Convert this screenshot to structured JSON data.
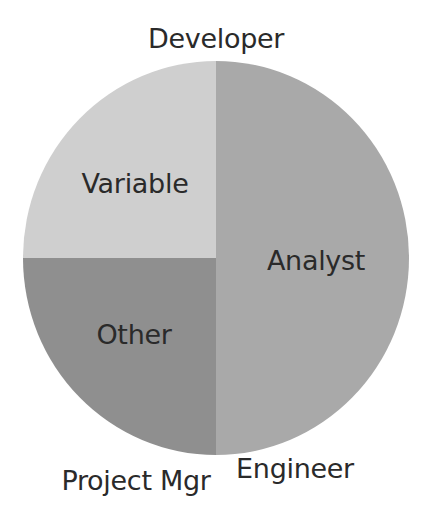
{
  "chart_data": {
    "type": "pie",
    "title": "",
    "categories": [
      "Developer",
      "Analyst",
      "Engineer",
      "Project Mgr",
      "Other",
      "Variable"
    ],
    "values": [
      0,
      50,
      0,
      0,
      25,
      25
    ],
    "colors": [
      "#b0b0b0",
      "#a9a9a9",
      "#9a9a9a",
      "#8c8c8c",
      "#8f8f8f",
      "#cfcfcf"
    ],
    "start_angle_deg": 0,
    "direction": "clockwise",
    "legend": "none",
    "data_labels": "category_name"
  },
  "labels": {
    "developer": "Developer",
    "analyst": "Analyst",
    "engineer": "Engineer",
    "project_mgr": "Project Mgr",
    "other": "Other",
    "variable": "Variable"
  }
}
